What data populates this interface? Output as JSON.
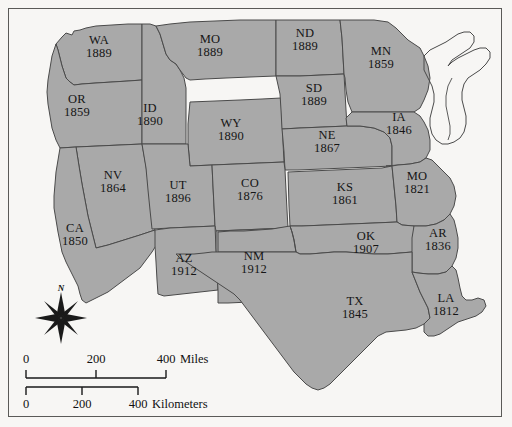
{
  "map": {
    "title": "Western United States statehood map",
    "colors": {
      "state_fill": "#a9a9a9",
      "state_stroke": "#4a4a4a",
      "background": "#f7f6f4",
      "label_text": "#151515",
      "border": "#5a5a58"
    },
    "states": [
      {
        "abbr": "WA",
        "year": "1889",
        "x": 99,
        "y": 47
      },
      {
        "abbr": "OR",
        "year": "1859",
        "x": 77,
        "y": 106
      },
      {
        "abbr": "ID",
        "year": "1890",
        "x": 150,
        "y": 115
      },
      {
        "abbr": "MO",
        "year": "1889",
        "x": 210,
        "y": 46
      },
      {
        "abbr": "WY",
        "year": "1890",
        "x": 231,
        "y": 130
      },
      {
        "abbr": "ND",
        "year": "1889",
        "x": 305,
        "y": 40
      },
      {
        "abbr": "SD",
        "year": "1889",
        "x": 314,
        "y": 95
      },
      {
        "abbr": "MN",
        "year": "1859",
        "x": 381,
        "y": 58
      },
      {
        "abbr": "NE",
        "year": "1867",
        "x": 327,
        "y": 142
      },
      {
        "abbr": "IA",
        "year": "1846",
        "x": 399,
        "y": 124
      },
      {
        "abbr": "NV",
        "year": "1864",
        "x": 113,
        "y": 182
      },
      {
        "abbr": "UT",
        "year": "1896",
        "x": 178,
        "y": 192
      },
      {
        "abbr": "CO",
        "year": "1876",
        "x": 250,
        "y": 190
      },
      {
        "abbr": "KS",
        "year": "1861",
        "x": 345,
        "y": 194
      },
      {
        "abbr": "MO",
        "year": "1821",
        "x": 417,
        "y": 183
      },
      {
        "abbr": "CA",
        "year": "1850",
        "x": 75,
        "y": 235
      },
      {
        "abbr": "AZ",
        "year": "1912",
        "x": 184,
        "y": 265
      },
      {
        "abbr": "NM",
        "year": "1912",
        "x": 254,
        "y": 263
      },
      {
        "abbr": "OK",
        "year": "1907",
        "x": 366,
        "y": 243
      },
      {
        "abbr": "AR",
        "year": "1836",
        "x": 438,
        "y": 240
      },
      {
        "abbr": "TX",
        "year": "1845",
        "x": 355,
        "y": 308
      },
      {
        "abbr": "LA",
        "year": "1812",
        "x": 446,
        "y": 305
      }
    ],
    "compass": {
      "north_label": "N",
      "icon": "compass-rose-icon"
    },
    "scale_miles": {
      "ticks": [
        "0",
        "200",
        "400"
      ],
      "unit": "Miles"
    },
    "scale_km": {
      "ticks": [
        "0",
        "200",
        "400"
      ],
      "unit": "Kilometers"
    }
  }
}
